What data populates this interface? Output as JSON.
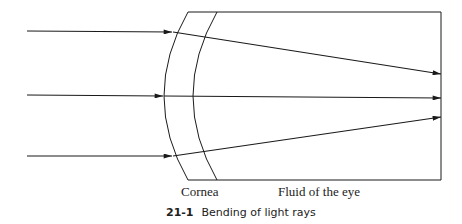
{
  "figure": {
    "number": "21-1",
    "title": "Bending of light rays"
  },
  "labels": {
    "cornea": "Cornea",
    "fluid": "Fluid of the eye"
  },
  "colors": {
    "stroke": "#1a1a1a",
    "background": "#ffffff"
  }
}
